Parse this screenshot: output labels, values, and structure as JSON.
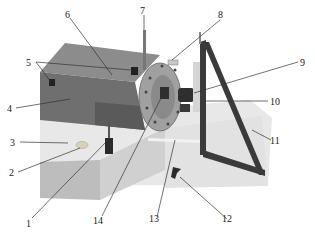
{
  "figure": {
    "colors": {
      "background": "#ffffff",
      "base_top": "#e6e6e6",
      "base_front": "#bdbdbd",
      "base_side": "#cfcfcf",
      "housing_top": "#8a8a8a",
      "housing_front": "#6e6e6e",
      "flange": "#9a9a9a",
      "dark_part": "#2e2e2e",
      "frame": "#3a3a3a",
      "leader_line": "#333333",
      "label_text": "#222222"
    },
    "labels": [
      {
        "id": "1",
        "text": "1"
      },
      {
        "id": "2",
        "text": "2"
      },
      {
        "id": "3",
        "text": "3"
      },
      {
        "id": "4",
        "text": "4"
      },
      {
        "id": "5",
        "text": "5"
      },
      {
        "id": "6",
        "text": "6"
      },
      {
        "id": "7",
        "text": "7"
      },
      {
        "id": "8",
        "text": "8"
      },
      {
        "id": "9",
        "text": "9"
      },
      {
        "id": "10",
        "text": "10"
      },
      {
        "id": "11",
        "text": "11"
      },
      {
        "id": "12",
        "text": "12"
      },
      {
        "id": "13",
        "text": "13"
      },
      {
        "id": "14",
        "text": "14"
      }
    ]
  }
}
